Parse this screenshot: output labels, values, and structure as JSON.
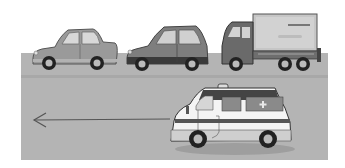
{
  "scene": {
    "description": "Illustration: ambulance moving left on a road while three vehicles (two cars and a truck) wait at the top",
    "background_color": "#ffffff",
    "road_color": "#b4b4b4",
    "vehicles": [
      {
        "type": "sedan",
        "position": "top-left",
        "body_color": "#9a9a9a"
      },
      {
        "type": "hatchback",
        "position": "top-middle",
        "body_color": "#7e7e7e"
      },
      {
        "type": "box-truck",
        "position": "top-right",
        "body_color": "#6a6a6a",
        "box_color": "#c6c6c6"
      },
      {
        "type": "ambulance",
        "position": "bottom-right",
        "body_color": "#f4f4f4",
        "stripe_color": "#555555",
        "direction": "left"
      }
    ],
    "arrow": {
      "direction": "left",
      "color": "#555555"
    }
  }
}
